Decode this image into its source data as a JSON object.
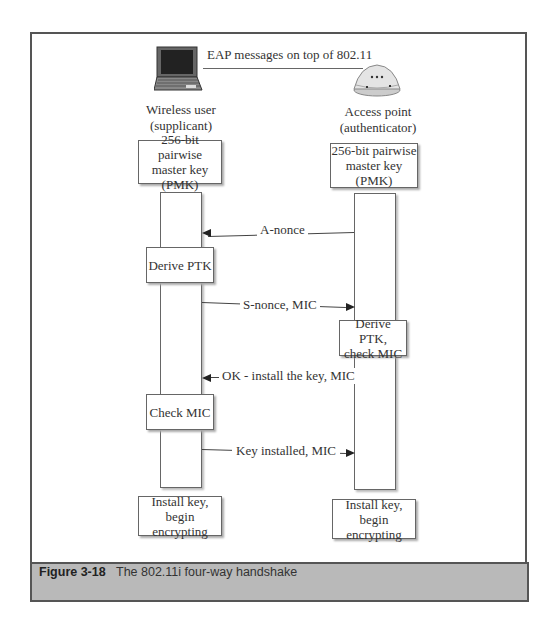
{
  "figure": {
    "number": "Figure 3-18",
    "title": "The 802.11i four-way handshake"
  },
  "top": {
    "link_label": "EAP messages on top of 802.11",
    "left_actor": {
      "icon": "laptop-icon",
      "line1": "Wireless user",
      "line2": "(supplicant)"
    },
    "right_actor": {
      "icon": "access-point-icon",
      "line1": "Access point",
      "line2": "(authenticator)"
    }
  },
  "left_pmk": {
    "line1": "256-bit pairwise",
    "line2": "master key",
    "line3": "(PMK)"
  },
  "right_pmk": {
    "line1": "256-bit pairwise",
    "line2": "master key",
    "line3": "(PMK)"
  },
  "messages": [
    {
      "label": "A-nonce",
      "direction": "right-to-left"
    },
    {
      "label": "S-nonce, MIC",
      "direction": "left-to-right"
    },
    {
      "label": "OK - install the key, MIC",
      "direction": "right-to-left"
    },
    {
      "label": "Key installed, MIC",
      "direction": "left-to-right"
    }
  ],
  "left_steps": [
    {
      "line1": "Derive PTK"
    },
    {
      "line1": "Check MIC"
    }
  ],
  "right_steps": [
    {
      "line1": "Derive PTK,",
      "line2": "check MIC"
    }
  ],
  "left_final": {
    "line1": "Install key,",
    "line2": "begin encrypting"
  },
  "right_final": {
    "line1": "Install key,",
    "line2": "begin encrypting"
  }
}
